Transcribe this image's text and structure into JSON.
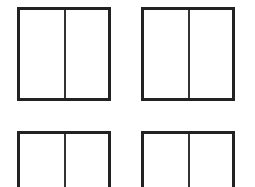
{
  "diagram": {
    "panels": [
      {
        "id": "top-left",
        "sections": 2
      },
      {
        "id": "top-right",
        "sections": 2
      },
      {
        "id": "bottom-left",
        "sections": 2,
        "cropped": true
      },
      {
        "id": "bottom-right",
        "sections": 2,
        "cropped": true
      }
    ],
    "colors": {
      "border": "#222222",
      "divider": "#333333",
      "background": "#ffffff"
    }
  }
}
